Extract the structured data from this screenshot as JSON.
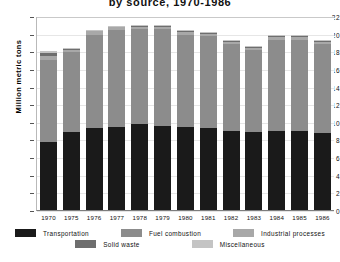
{
  "chart_data": {
    "type": "bar",
    "stacked": true,
    "title": "by source, 1970-1986",
    "xlabel": "",
    "ylabel": "Million metric tons",
    "ylim": [
      0,
      22
    ],
    "ytick_step": 2,
    "yticks": [
      "22",
      "20",
      "18",
      "16",
      "14",
      "12",
      "10",
      "8",
      "6",
      "4",
      "2",
      "0"
    ],
    "grid": true,
    "legend_position": "bottom",
    "categories": [
      "1970",
      "1975",
      "1976",
      "1977",
      "1978",
      "1979",
      "1980",
      "1981",
      "1982",
      "1983",
      "1984",
      "1985",
      "1986"
    ],
    "series": [
      {
        "name": "Transportation",
        "color": "#1a1a1a",
        "values": [
          7.7,
          8.9,
          9.3,
          9.4,
          9.7,
          9.5,
          9.4,
          9.3,
          9.0,
          8.8,
          9.0,
          9.0,
          8.7
        ]
      },
      {
        "name": "Fuel combustion",
        "color": "#8c8c8c",
        "values": [
          9.3,
          9.0,
          10.6,
          11.0,
          10.8,
          11.0,
          10.5,
          10.4,
          9.8,
          9.3,
          10.3,
          10.3,
          10.1
        ]
      },
      {
        "name": "Industrial processes",
        "color": "#a8a8a8",
        "values": [
          0.45,
          0.3,
          0.35,
          0.3,
          0.3,
          0.3,
          0.3,
          0.3,
          0.3,
          0.3,
          0.3,
          0.3,
          0.3
        ]
      },
      {
        "name": "Solid waste",
        "color": "#6e6e6e",
        "values": [
          0.4,
          0.1,
          0.1,
          0.1,
          0.1,
          0.1,
          0.1,
          0.1,
          0.1,
          0.1,
          0.1,
          0.1,
          0.1
        ]
      },
      {
        "name": "Miscellaneous",
        "color": "#c4c4c4",
        "values": [
          0.15,
          0.1,
          0.1,
          0.1,
          0.1,
          0.1,
          0.1,
          0.1,
          0.1,
          0.1,
          0.1,
          0.1,
          0.1
        ]
      }
    ],
    "totals": [
      18.0,
      18.4,
      20.45,
      20.9,
      21.0,
      21.0,
      20.4,
      20.2,
      19.3,
      18.6,
      19.8,
      19.8,
      19.3
    ]
  },
  "legend": {
    "row1": [
      "Transportation",
      "Fuel combustion",
      "Industrial processes"
    ],
    "row2": [
      "Solid waste",
      "Miscellaneous"
    ]
  }
}
